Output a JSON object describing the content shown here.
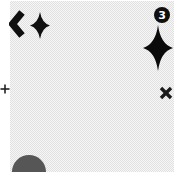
{
  "canvas": {
    "page_background": "#ffffff",
    "panel_checker_dark": "#e1e1e1",
    "panel_checker_light": "#f6f6f6"
  },
  "badge": {
    "count": "3",
    "background": "#0f0f0f",
    "text_color": "#ffffff"
  },
  "icons": {
    "back_chevron": {
      "color": "#0f0f0f"
    },
    "small_sparkle": {
      "color": "#101010"
    },
    "large_sparkle": {
      "color": "#0b0b0b"
    },
    "close_x": {
      "color": "#1a1a1a"
    },
    "plus": {
      "color": "#222222"
    },
    "dome": {
      "color": "#565656"
    }
  }
}
